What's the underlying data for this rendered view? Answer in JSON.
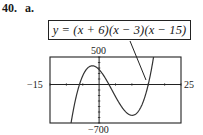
{
  "problem": {
    "number": "40.",
    "part": "a."
  },
  "equation": {
    "text": "y = (x + 6)(x − 3)(x − 15)"
  },
  "window": {
    "xmin_label": "−15",
    "xmax_label": "25",
    "ymax_label": "500",
    "ymin_label": "−700"
  },
  "chart_data": {
    "type": "line",
    "title": "y = (x + 6)(x − 3)(x − 15)",
    "xlabel": "",
    "ylabel": "",
    "xlim": [
      -15,
      25
    ],
    "ylim": [
      -700,
      500
    ],
    "grid": false,
    "axes_ticks": {
      "x_step": 5,
      "y_step": 100
    },
    "function": "(x+6)*(x-3)*(x-15)",
    "roots": [
      -6,
      3,
      15
    ],
    "local_max": {
      "x": -1.5,
      "y": 334
    },
    "local_min": {
      "x": 10,
      "y": -560
    },
    "series": [
      {
        "name": "y = (x + 6)(x − 3)(x − 15)",
        "x": [
          -10,
          -8,
          -6,
          -4,
          -2,
          -1.5,
          0,
          2,
          3,
          4,
          6,
          8,
          10,
          12,
          14,
          15,
          16,
          17,
          18
        ],
        "y": [
          -700,
          -242,
          0,
          154,
          330,
          334,
          270,
          52,
          0,
          -110,
          -324,
          -490,
          -560,
          -486,
          -220,
          0,
          286,
          644,
          1080
        ]
      }
    ],
    "annotations": [
      {
        "text": "y = (x + 6)(x − 3)(x − 15)",
        "points_to": "curve"
      }
    ]
  }
}
